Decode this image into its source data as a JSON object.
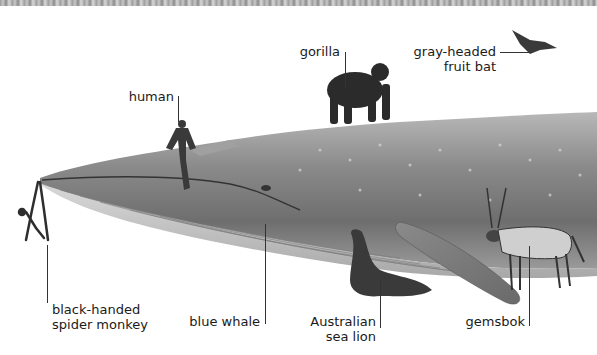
{
  "labels": {
    "gorilla": "gorilla",
    "bat_line1": "gray-headed",
    "bat_line2": "fruit bat",
    "human": "human",
    "monkey_line1": "black-handed",
    "monkey_line2": "spider monkey",
    "blue_whale": "blue whale",
    "sealion_line1": "Australian",
    "sealion_line2": "sea lion",
    "gemsbok": "gemsbok"
  },
  "colors": {
    "background": "#ffffff",
    "whale_top": "#8c8c8c",
    "whale_belly": "#cfcfcf",
    "leader": "#333333",
    "text": "#1a1a1a"
  }
}
